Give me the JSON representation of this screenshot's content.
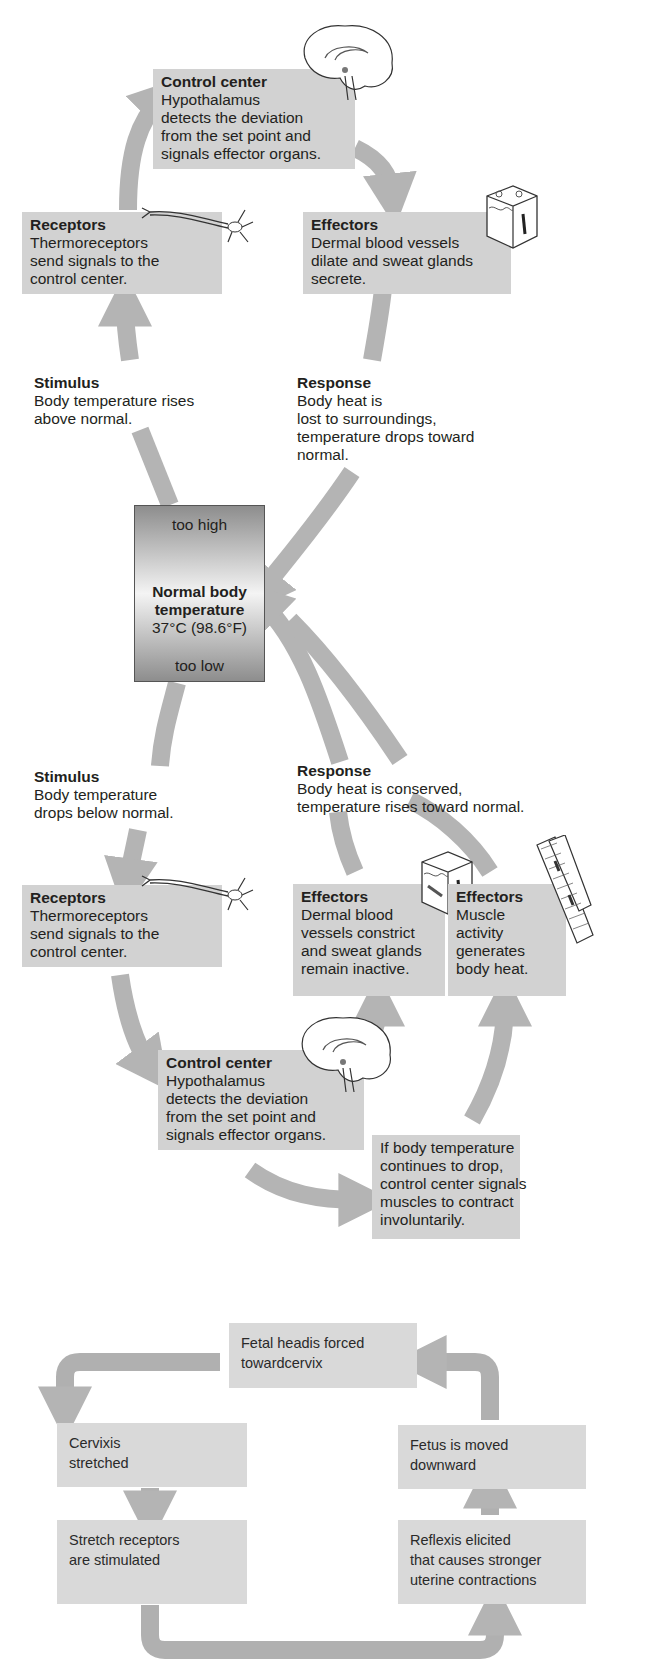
{
  "diagram1": {
    "control_center_top": {
      "title": "Control center",
      "lines": [
        "Hypothalamus",
        "detects the deviation",
        "from the set point and",
        "signals effector organs."
      ]
    },
    "receptors_top": {
      "title": "Receptors",
      "lines": [
        "Thermoreceptors",
        "send signals to the",
        "control center."
      ]
    },
    "effectors_top": {
      "title": "Effectors",
      "lines": [
        "Dermal blood vessels",
        "dilate and sweat glands",
        "secrete."
      ]
    },
    "stimulus_top": {
      "title": "Stimulus",
      "lines": [
        "Body temperature rises",
        "above normal."
      ]
    },
    "response_top": {
      "title": "Response",
      "lines": [
        "Body heat is",
        "lost to surroundings,",
        "temperature drops toward",
        "normal."
      ]
    },
    "thermometer": {
      "too_high": "too high",
      "title_line1": "Normal body",
      "title_line2": "temperature",
      "value": "37°C (98.6°F)",
      "too_low": "too low"
    },
    "stimulus_bottom": {
      "title": "Stimulus",
      "lines": [
        "Body temperature",
        "drops below normal."
      ]
    },
    "response_bottom": {
      "title": "Response",
      "lines": [
        "Body heat is conserved,",
        "temperature rises toward normal."
      ]
    },
    "receptors_bottom": {
      "title": "Receptors",
      "lines": [
        "Thermoreceptors",
        "send signals to the",
        "control center."
      ]
    },
    "effectors_dermal": {
      "title": "Effectors",
      "lines": [
        "Dermal blood",
        "vessels constrict",
        "and sweat glands",
        "remain inactive."
      ]
    },
    "effectors_muscle": {
      "title": "Effectors",
      "lines": [
        "Muscle",
        "activity",
        "generates",
        "body heat."
      ]
    },
    "control_center_bottom": {
      "title": "Control center",
      "lines": [
        "Hypothalamus",
        "detects the deviation",
        "from the set point and",
        "signals effector organs."
      ]
    },
    "shivering_note": {
      "lines": [
        "If body temperature",
        "continues to drop,",
        "control center signals",
        "muscles to contract",
        "involuntarily."
      ]
    },
    "colors": {
      "box": "#d2d2d2",
      "arrow": "#b4b4b4",
      "text": "#231f20"
    }
  },
  "diagram2": {
    "fetal_head": {
      "lines": [
        "Fetal headis forced",
        "towardcervix"
      ]
    },
    "cervix": {
      "lines": [
        "Cervixis",
        "stretched"
      ]
    },
    "stretch_receptors": {
      "lines": [
        "Stretch receptors",
        "are stimulated"
      ]
    },
    "fetus_moved": {
      "lines": [
        "Fetus is moved",
        "downward"
      ]
    },
    "reflex": {
      "lines": [
        "Reflexis elicited",
        "that causes stronger",
        "uterine contractions"
      ]
    },
    "colors": {
      "box": "#d9d9d9",
      "arrow": "#b0b0b0"
    }
  }
}
